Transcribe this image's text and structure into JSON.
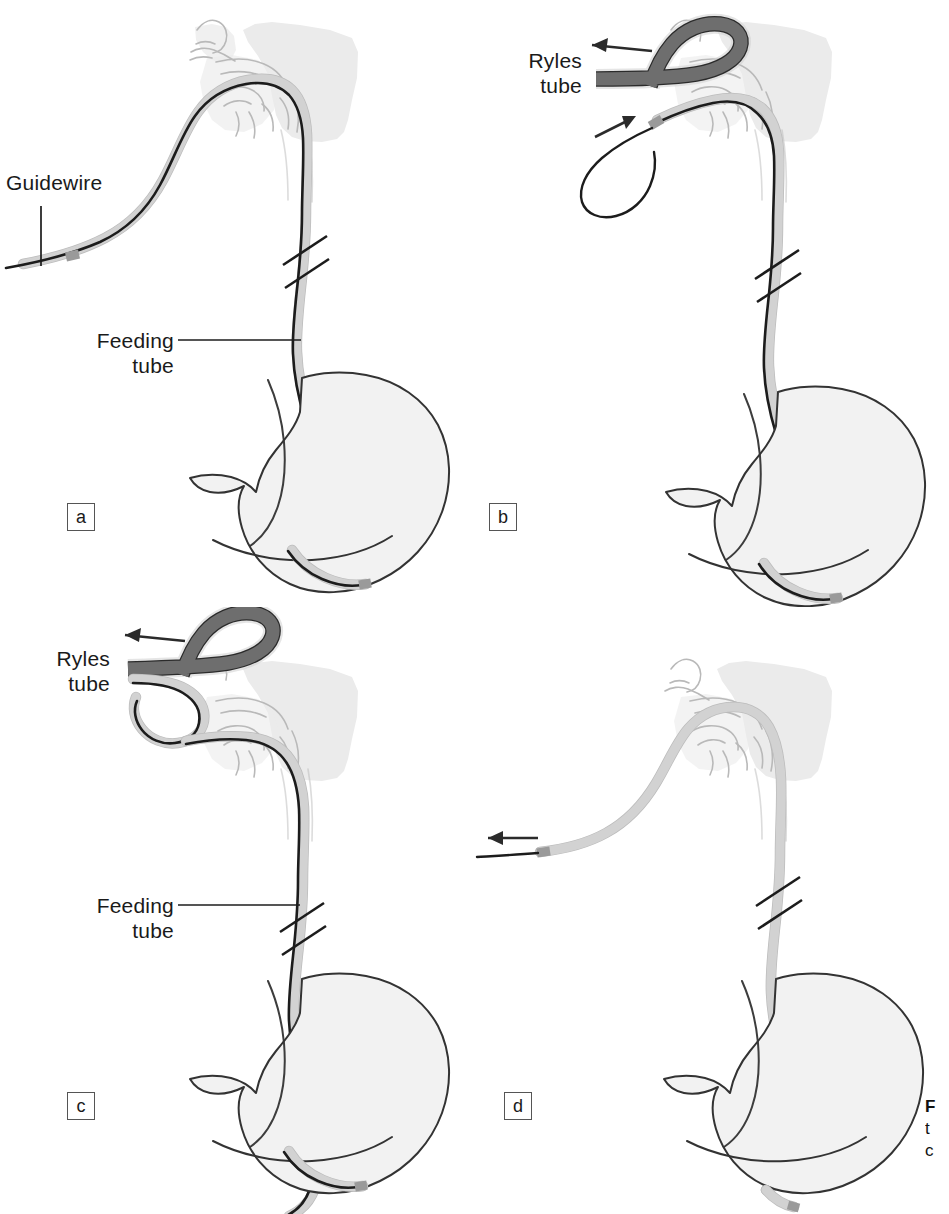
{
  "figure": {
    "kind": "medical-illustration",
    "background_color": "#ffffff",
    "width": 949,
    "height": 1214
  },
  "colors": {
    "ink": "#1a1a1a",
    "outline": "#333333",
    "anatomy_fill": "#ebebeb",
    "anatomy_line": "#b9b9b9",
    "stomach_fill": "#f2f2f2",
    "feeding_tube": "#d2d2d2",
    "feeding_tube_edge": "#bcbcbc",
    "guidewire": "#1c1c1c",
    "ryles_tube": "#6e6e6e",
    "ryles_tube_edge": "#2b2b2b"
  },
  "panels": [
    {
      "id": "a",
      "tag": "a",
      "labels": [
        {
          "name": "guidewire",
          "text": "Guidewire",
          "lines": [
            "Guidewire"
          ]
        },
        {
          "name": "feeding-tube",
          "text": "Feeding tube",
          "lines": [
            "Feeding",
            "tube"
          ]
        }
      ]
    },
    {
      "id": "b",
      "tag": "b",
      "labels": [
        {
          "name": "ryles-tube",
          "text": "Ryles tube",
          "lines": [
            "Ryles",
            "tube"
          ]
        }
      ]
    },
    {
      "id": "c",
      "tag": "c",
      "labels": [
        {
          "name": "ryles-tube",
          "text": "Ryles tube",
          "lines": [
            "Ryles",
            "tube"
          ]
        },
        {
          "name": "feeding-tube",
          "text": "Feeding tube",
          "lines": [
            "Feeding",
            "tube"
          ]
        }
      ]
    },
    {
      "id": "d",
      "tag": "d",
      "labels": []
    }
  ],
  "label_text": {
    "guidewire": "Guidewire",
    "feeding_line1": "Feeding",
    "feeding_line2": "tube",
    "ryles_line1": "Ryles",
    "ryles_line2": "tube"
  },
  "panel_tags": {
    "a": "a",
    "b": "b",
    "c": "c",
    "d": "d"
  },
  "caption": {
    "clipped": true,
    "line1": "F",
    "line2": "t",
    "line3": "c"
  }
}
